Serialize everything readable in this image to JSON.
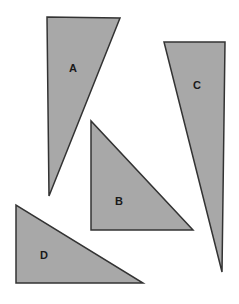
{
  "figure": {
    "width": 239,
    "height": 304,
    "background_color": "#ffffff",
    "fill_color": "#a8a8a8",
    "stroke_color": "#333333",
    "stroke_width": 1.5,
    "label_color": "#1a1a1a",
    "label_font_size": 11
  },
  "shapes": [
    {
      "id": "triangle-a",
      "label": "A",
      "type": "triangle",
      "points": "47,17 120,18 49,196",
      "vertices": [
        [
          47,
          17
        ],
        [
          120,
          18
        ],
        [
          49,
          196
        ]
      ],
      "label_x": 73,
      "label_y": 69,
      "description": "tall narrow wedge, vertical left edge, apex at bottom"
    },
    {
      "id": "triangle-b",
      "label": "B",
      "type": "triangle",
      "points": "91,121 91,230 193,230",
      "vertices": [
        [
          91,
          121
        ],
        [
          91,
          230
        ],
        [
          193,
          230
        ]
      ],
      "label_x": 119,
      "label_y": 202,
      "description": "right triangle, right angle at bottom-left"
    },
    {
      "id": "triangle-c",
      "label": "C",
      "type": "triangle",
      "points": "164,42 225,42 222,272",
      "vertices": [
        [
          164,
          42
        ],
        [
          225,
          42
        ],
        [
          222,
          272
        ]
      ],
      "label_x": 197,
      "label_y": 86,
      "description": "tall narrow sliver, vertical right edge, apex at bottom"
    },
    {
      "id": "triangle-d",
      "label": "D",
      "type": "triangle",
      "points": "16,205 16,283 143,283",
      "vertices": [
        [
          16,
          205
        ],
        [
          16,
          283
        ],
        [
          143,
          283
        ]
      ],
      "label_x": 44,
      "label_y": 256,
      "description": "right triangle, right angle at bottom-left"
    }
  ]
}
